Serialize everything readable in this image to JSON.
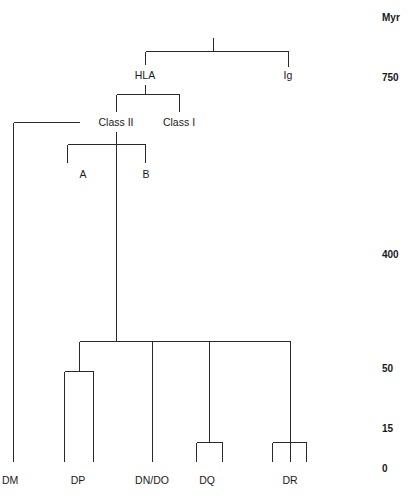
{
  "figure": {
    "type": "phylogenetic-tree",
    "orientation": "top-down",
    "axis": {
      "header": "Myr",
      "ticks": [
        {
          "label": "750",
          "y": 77
        },
        {
          "label": "400",
          "y": 254
        },
        {
          "label": "50",
          "y": 368
        },
        {
          "label": "15",
          "y": 428
        },
        {
          "label": "0",
          "y": 468
        }
      ]
    },
    "internal_nodes": [
      {
        "id": "root",
        "label": "",
        "x": 213,
        "y": 51
      },
      {
        "id": "hla",
        "label": "HLA",
        "x": 145,
        "y": 75
      },
      {
        "id": "ig",
        "label": "Ig",
        "x": 288,
        "y": 75
      },
      {
        "id": "class2",
        "label": "Class II",
        "x": 116,
        "y": 122
      },
      {
        "id": "class1",
        "label": "Class I",
        "x": 179,
        "y": 122
      },
      {
        "id": "chainA",
        "label": "A",
        "x": 83,
        "y": 174
      },
      {
        "id": "chainB",
        "label": "B",
        "x": 146,
        "y": 174
      }
    ],
    "tips": [
      {
        "id": "dm",
        "label": "DM",
        "x": 13
      },
      {
        "id": "dp",
        "label": "DP",
        "x": 78
      },
      {
        "id": "dndo",
        "label": "DN/DO",
        "x": 152
      },
      {
        "id": "dq",
        "label": "DQ",
        "x": 207
      },
      {
        "id": "dr",
        "label": "DR",
        "x": 290
      }
    ],
    "tip_label_y": 484,
    "colors": {
      "branch": "#2a2a2a",
      "text": "#1a1a1a",
      "background": "#ffffff"
    }
  }
}
